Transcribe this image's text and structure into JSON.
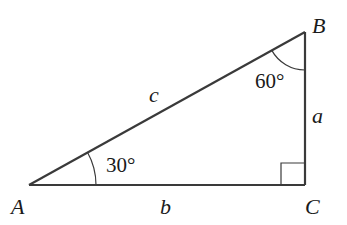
{
  "diagram": {
    "type": "right-triangle",
    "vertices": {
      "A": {
        "label": "A",
        "x": 29,
        "y": 185
      },
      "B": {
        "label": "B",
        "x": 305,
        "y": 32
      },
      "C": {
        "label": "C",
        "x": 305,
        "y": 185
      }
    },
    "sides": {
      "a": {
        "label": "a"
      },
      "b": {
        "label": "b"
      },
      "c": {
        "label": "c"
      }
    },
    "angles": {
      "A": {
        "label": "30°"
      },
      "B": {
        "label": "60°"
      },
      "C": {
        "label": "right-angle"
      }
    },
    "colors": {
      "stroke": "#3a3a3a",
      "text": "#1a1a1a"
    }
  }
}
